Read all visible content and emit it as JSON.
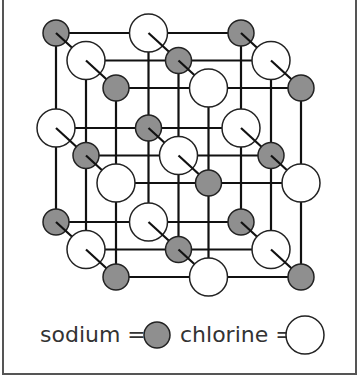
{
  "diagram": {
    "type": "3x3x3 cubic ionic lattice",
    "colors": {
      "sodium_fill": "#8f8f8f",
      "chlorine_fill": "#ffffff",
      "stroke": "#222222",
      "bond": "#111111"
    },
    "layer_offset": [
      30,
      27.5
    ],
    "grid_x": [
      56,
      148.5,
      241
    ],
    "grid_y": [
      33,
      128,
      222
    ],
    "radius": {
      "sodium": 13,
      "chlorine": 19
    }
  },
  "legend": {
    "sodium_label": "sodium =",
    "chlorine_label": "chlorine ="
  }
}
